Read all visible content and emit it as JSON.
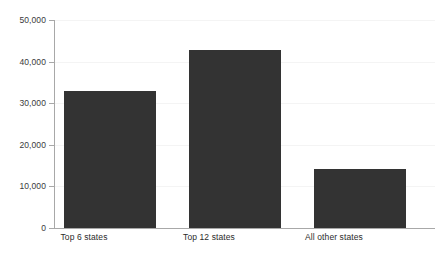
{
  "chart_data": {
    "type": "bar",
    "title": "",
    "subtitle": "",
    "xlabel": "",
    "ylabel": "",
    "categories": [
      "Top 6 states",
      "Top 12 states",
      "All other states"
    ],
    "values": [
      33000,
      42800,
      14200
    ],
    "ylim": [
      0,
      50000
    ],
    "ytick_values": [
      0,
      10000,
      20000,
      30000,
      40000,
      50000
    ],
    "ytick_labels": [
      "0",
      "10,000",
      "20,000",
      "30,000",
      "40,000",
      "50,000"
    ],
    "grid": false,
    "legend": "none",
    "bar_color": "#333333",
    "axis_color": "#a8a8a8",
    "background_color": "#ffffff",
    "tick_label_color": "#3a3a3a",
    "category_label_color": "#2b2b2b"
  }
}
